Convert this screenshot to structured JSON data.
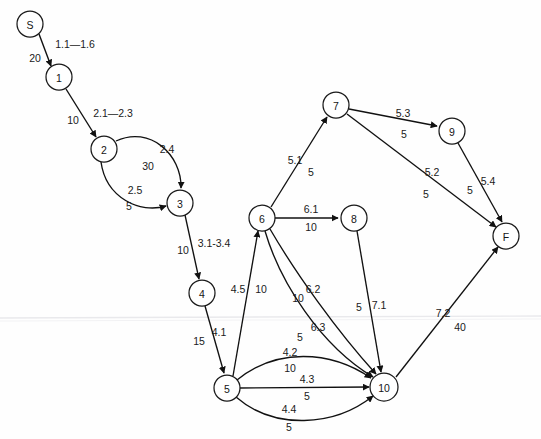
{
  "diagram": {
    "background_color": "#fefefe",
    "stroke_color": "#111111",
    "label_color": "#1a1a1a",
    "width": 541,
    "height": 439
  },
  "nodes": [
    {
      "id": "S",
      "label": "S",
      "cx": 30,
      "cy": 24,
      "r": 13
    },
    {
      "id": "1",
      "label": "1",
      "cx": 59,
      "cy": 77,
      "r": 13
    },
    {
      "id": "2",
      "label": "2",
      "cx": 104,
      "cy": 149,
      "r": 13
    },
    {
      "id": "3",
      "label": "3",
      "cx": 180,
      "cy": 203,
      "r": 13
    },
    {
      "id": "4",
      "label": "4",
      "cx": 202,
      "cy": 293,
      "r": 13
    },
    {
      "id": "5",
      "label": "5",
      "cx": 227,
      "cy": 388,
      "r": 13
    },
    {
      "id": "6",
      "label": "6",
      "cx": 262,
      "cy": 218,
      "r": 13
    },
    {
      "id": "7",
      "label": "7",
      "cx": 336,
      "cy": 105,
      "r": 13
    },
    {
      "id": "8",
      "label": "8",
      "cx": 354,
      "cy": 218,
      "r": 13
    },
    {
      "id": "9",
      "label": "9",
      "cx": 452,
      "cy": 131,
      "r": 13
    },
    {
      "id": "10",
      "label": "10",
      "cx": 384,
      "cy": 387,
      "r": 14
    },
    {
      "id": "F",
      "label": "F",
      "cx": 506,
      "cy": 236,
      "r": 13
    }
  ],
  "edges": [
    {
      "id": "e-s-1",
      "from": "S",
      "to": "1",
      "tag": "1.1—1.6",
      "weight": "20",
      "tag_x": 75,
      "tag_y": 44,
      "weight_x": 35,
      "weight_y": 58
    },
    {
      "id": "e-1-2",
      "from": "1",
      "to": "2",
      "tag": "2.1—2.3",
      "weight": "10",
      "tag_x": 113,
      "tag_y": 113,
      "weight_x": 73,
      "weight_y": 120
    },
    {
      "id": "e-2-3-a",
      "from": "2",
      "to": "3",
      "tag": "2.4",
      "weight": "30",
      "tag_x": 167,
      "tag_y": 149,
      "weight_x": 148,
      "weight_y": 166
    },
    {
      "id": "e-2-3-b",
      "from": "2",
      "to": "3",
      "tag": "2.5",
      "weight": "5",
      "tag_x": 135,
      "tag_y": 190,
      "weight_x": 129,
      "weight_y": 206
    },
    {
      "id": "e-3-4",
      "from": "3",
      "to": "4",
      "tag": "3.1-3.4",
      "weight": "10",
      "tag_x": 214,
      "tag_y": 243,
      "weight_x": 183,
      "weight_y": 250
    },
    {
      "id": "e-4-5",
      "from": "4",
      "to": "5",
      "tag": "4.1",
      "weight": "15",
      "tag_x": 219,
      "tag_y": 332,
      "weight_x": 199,
      "weight_y": 341
    },
    {
      "id": "e-5-6",
      "from": "5",
      "to": "6",
      "tag": "4.5",
      "weight": "10",
      "tag_x": 238,
      "tag_y": 289,
      "weight_x": 261,
      "weight_y": 289
    },
    {
      "id": "e-5-10-a",
      "from": "5",
      "to": "10",
      "tag": "4.2",
      "weight": "10",
      "tag_x": 290,
      "tag_y": 352,
      "weight_x": 290,
      "weight_y": 368
    },
    {
      "id": "e-5-10-b",
      "from": "5",
      "to": "10",
      "tag": "4.3",
      "weight": "5",
      "tag_x": 307,
      "tag_y": 379,
      "weight_x": 307,
      "weight_y": 396
    },
    {
      "id": "e-5-10-c",
      "from": "5",
      "to": "10",
      "tag": "4.4",
      "weight": "5",
      "tag_x": 289,
      "tag_y": 409,
      "weight_x": 289,
      "weight_y": 427
    },
    {
      "id": "e-6-7",
      "from": "6",
      "to": "7",
      "tag": "5.1",
      "weight": "5",
      "tag_x": 295,
      "tag_y": 160,
      "weight_x": 311,
      "weight_y": 172
    },
    {
      "id": "e-6-8",
      "from": "6",
      "to": "8",
      "tag": "6.1",
      "weight": "10",
      "tag_x": 311,
      "tag_y": 209,
      "weight_x": 311,
      "weight_y": 227
    },
    {
      "id": "e-6-10-a",
      "from": "6",
      "to": "10",
      "tag": "6.2",
      "weight": "10",
      "tag_x": 313,
      "tag_y": 289,
      "weight_x": 298,
      "weight_y": 298
    },
    {
      "id": "e-6-10-b",
      "from": "6",
      "to": "10",
      "tag": "6.3",
      "weight": "5",
      "tag_x": 318,
      "tag_y": 327,
      "weight_x": 300,
      "weight_y": 337
    },
    {
      "id": "e-7-9",
      "from": "7",
      "to": "9",
      "tag": "5.3",
      "weight": "5",
      "tag_x": 403,
      "tag_y": 113,
      "weight_x": 404,
      "weight_y": 134
    },
    {
      "id": "e-7-F",
      "from": "7",
      "to": "F",
      "tag": "5.2",
      "weight": "5",
      "tag_x": 432,
      "tag_y": 172,
      "weight_x": 426,
      "weight_y": 194
    },
    {
      "id": "e-9-F",
      "from": "9",
      "to": "F",
      "tag": "5.4",
      "weight": "5",
      "tag_x": 488,
      "tag_y": 181,
      "weight_x": 470,
      "weight_y": 190
    },
    {
      "id": "e-8-10",
      "from": "8",
      "to": "10",
      "tag": "7.1",
      "weight": "5",
      "tag_x": 379,
      "tag_y": 305,
      "weight_x": 359,
      "weight_y": 307
    },
    {
      "id": "e-10-F",
      "from": "10",
      "to": "F",
      "tag": "7.2",
      "weight": "40",
      "tag_x": 443,
      "tag_y": 313,
      "weight_x": 460,
      "weight_y": 327
    }
  ],
  "geometry": {
    "paths": {
      "e-s-1": "M 39 34 L 51 66",
      "e-1-2": "M 66 89 L 96 137",
      "e-2-3-a": "M 116 141 C 150 125 182 155 181 188",
      "e-2-3-b": "M 101 162 C 106 198 140 214 166 206",
      "e-3-4": "M 185 215 L 199 279",
      "e-4-5": "M 205 306 L 224 373",
      "e-5-6": "M 233 376 L 258 231",
      "e-5-10-a": "M 237 380 C 276 348 330 350 371 378",
      "e-5-10-b": "M 240 388 L 369 387",
      "e-5-10-c": "M 236 397 C 274 430 334 427 373 396",
      "e-6-7": "M 271 207 L 327 117",
      "e-6-8": "M 275 218 L 338 218",
      "e-6-10-a": "M 270 229 C 295 272 336 330 376 374",
      "e-6-10-b": "M 265 231 C 280 282 320 345 373 377",
      "e-7-9": "M 349 109 L 437 126",
      "e-7-F": "M 347 114 L 496 227",
      "e-9-F": "M 458 143 L 502 222",
      "e-8-10": "M 357 231 L 381 372",
      "e-10-F": "M 396 377 L 498 247"
    }
  },
  "artifacts": {
    "scan_line_y": 318,
    "scan_line2_y": 321
  }
}
